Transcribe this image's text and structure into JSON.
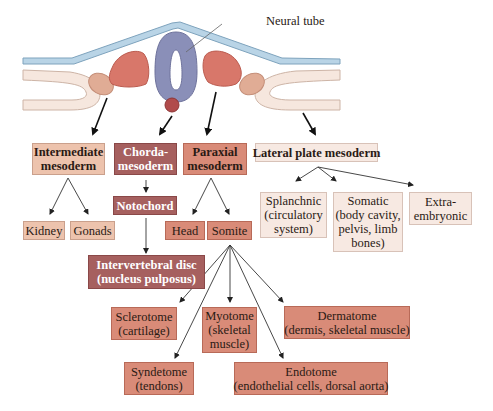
{
  "figure": {
    "callout_label": "Neural tube",
    "colors": {
      "ectoderm": "#b7d3e6",
      "ectoderm_stroke": "#7da2bd",
      "neural_tube": "#8b8fb8",
      "somite_red": "#d8776a",
      "intermediate": "#e0ac95",
      "lateral_plate": "#f6e6dc",
      "notochord": "#b24a4a",
      "box_light": "#f7e9e2",
      "box_peach": "#edc3ad",
      "box_salmon": "#d98b78",
      "box_maroon": "#a6605f"
    }
  },
  "boxes": {
    "intermediate": {
      "lines": [
        "Intermediate",
        "mesoderm"
      ]
    },
    "chorda": {
      "lines": [
        "Chorda-",
        "mesoderm"
      ]
    },
    "paraxial": {
      "lines": [
        "Paraxial",
        "mesoderm"
      ]
    },
    "lateral": {
      "lines": [
        "Lateral plate mesoderm"
      ]
    },
    "kidney": {
      "lines": [
        "Kidney"
      ]
    },
    "gonads": {
      "lines": [
        "Gonads"
      ]
    },
    "notochord": {
      "lines": [
        "Notochord"
      ]
    },
    "head": {
      "lines": [
        "Head"
      ]
    },
    "somite": {
      "lines": [
        "Somite"
      ]
    },
    "disc": {
      "lines": [
        "Intervertebral disc",
        "(nucleus pulposus)"
      ]
    },
    "splanchnic": {
      "lines": [
        "Splanchnic",
        "(circulatory",
        "system)"
      ]
    },
    "somatic": {
      "lines": [
        "Somatic",
        "(body cavity,",
        "pelvis, limb",
        "bones)"
      ]
    },
    "extra": {
      "lines": [
        "Extra-",
        "embryonic"
      ]
    },
    "sclerotome": {
      "lines": [
        "Sclerotome",
        "(cartilage)"
      ]
    },
    "myotome": {
      "lines": [
        "Myotome",
        "(skeletal",
        "muscle)"
      ]
    },
    "dermatome": {
      "lines": [
        "Dermatome",
        "(dermis, skeletal muscle)"
      ]
    },
    "syndetome": {
      "lines": [
        "Syndetome",
        "(tendons)"
      ]
    },
    "endotome": {
      "lines": [
        "Endotome",
        "(endothelial cells, dorsal aorta)"
      ]
    }
  }
}
